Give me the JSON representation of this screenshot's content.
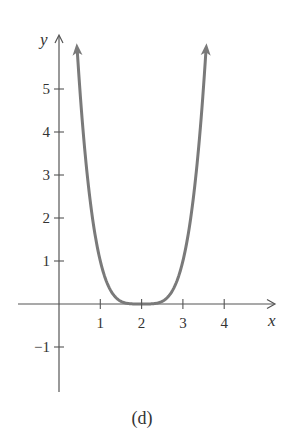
{
  "chart_data": {
    "type": "line",
    "title": "",
    "caption": "(d)",
    "xlabel": "x",
    "ylabel": "y",
    "function_description": "quartic curve y = (x - 2)^4, flat bottom touching x-axis at x = 2, arrows at both ends pointing upward",
    "x_ticks": [
      1,
      2,
      3,
      4
    ],
    "x_tick_labels": [
      "1",
      "2",
      "3",
      "4"
    ],
    "y_ticks": [
      -1,
      1,
      2,
      3,
      4,
      5
    ],
    "y_tick_labels": [
      "−1",
      "1",
      "2",
      "3",
      "4",
      "5"
    ],
    "xlim": [
      -1,
      5.2
    ],
    "ylim": [
      -1.9,
      6.2
    ],
    "grid": false,
    "legend": null,
    "series": [
      {
        "name": "curve",
        "color": "#7a7a7a",
        "x": [
          0.44,
          0.6,
          0.8,
          1.0,
          1.2,
          1.4,
          1.6,
          1.8,
          2.0,
          2.2,
          2.4,
          2.6,
          2.8,
          3.0,
          3.2,
          3.4,
          3.56
        ],
        "y": [
          5.92,
          3.84,
          2.07,
          1.0,
          0.41,
          0.13,
          0.03,
          0.0,
          0.0,
          0.0,
          0.03,
          0.13,
          0.41,
          1.0,
          2.07,
          3.84,
          5.92
        ]
      }
    ]
  },
  "colors": {
    "axis": "#555555",
    "curve": "#7a7a7a",
    "text": "#333333"
  }
}
